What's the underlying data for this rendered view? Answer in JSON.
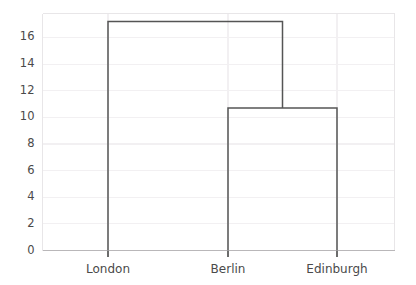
{
  "chart_data": {
    "type": "dendrogram",
    "title": "",
    "xlabel": "",
    "ylabel": "",
    "categories": [
      "London",
      "Berlin",
      "Edinburgh"
    ],
    "leaf_positions": [
      108,
      228,
      337
    ],
    "ylim": [
      0,
      17.8
    ],
    "yticks": [
      0,
      2,
      4,
      6,
      8,
      10,
      12,
      14,
      16
    ],
    "ytick_labels": [
      "0",
      "2",
      "4",
      "6",
      "8",
      "10",
      "12",
      "14",
      "16"
    ],
    "grid": true,
    "legend": "none",
    "links": [
      {
        "name": "berlin-edinburgh-merge",
        "left_label": "Berlin",
        "right_label": "Edinburgh",
        "left_x": 228,
        "right_x": 337,
        "left_height": 0,
        "right_height": 0,
        "height": 10.7
      },
      {
        "name": "london-cluster-merge",
        "left_label": "London",
        "right_label": "Berlin+Edinburgh",
        "left_x": 108,
        "right_x": 282.5,
        "left_height": 0,
        "right_height": 10.7,
        "height": 17.2
      }
    ],
    "line_color": "#555555",
    "grid_color": "#f2f0f2",
    "spine_color": "#e8e6e8",
    "tick_color": "#4a4a4a"
  },
  "axes": {
    "y_ticks": [
      {
        "value": 0,
        "label": "0"
      },
      {
        "value": 2,
        "label": "2"
      },
      {
        "value": 4,
        "label": "4"
      },
      {
        "value": 6,
        "label": "6"
      },
      {
        "value": 8,
        "label": "8"
      },
      {
        "value": 10,
        "label": "10"
      },
      {
        "value": 12,
        "label": "12"
      },
      {
        "value": 14,
        "label": "14"
      },
      {
        "value": 16,
        "label": "16"
      }
    ],
    "x_ticks": [
      {
        "label": "London"
      },
      {
        "label": "Berlin"
      },
      {
        "label": "Edinburgh"
      }
    ]
  }
}
